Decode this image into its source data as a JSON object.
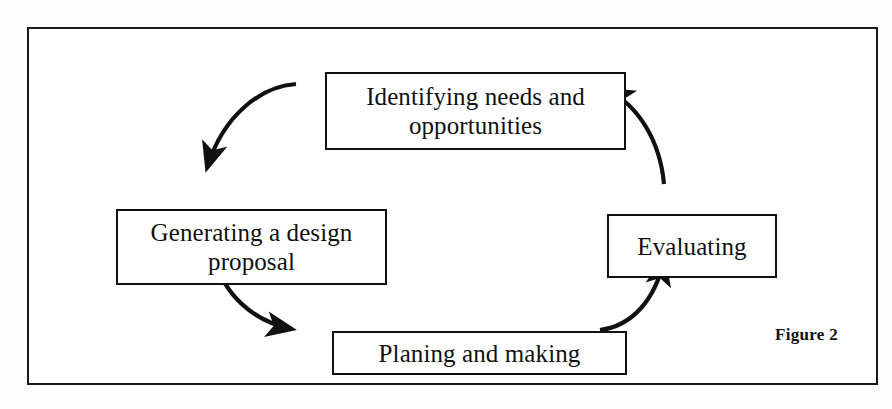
{
  "figure": {
    "caption": "Figure 2",
    "frame_color": "#1a1a1a",
    "background_color": "#ffffff",
    "stroke_color": "#111111"
  },
  "diagram": {
    "type": "cycle",
    "direction": "clockwise",
    "nodes": [
      {
        "id": "identifying",
        "label": "Identifying needs and opportunities",
        "line1": "Identifying needs and",
        "line2": "opportunities",
        "position": "top"
      },
      {
        "id": "generating",
        "label": "Generating a design proposal",
        "line1": "Generating a design",
        "line2": "proposal",
        "position": "left"
      },
      {
        "id": "planing",
        "label": "Planing and making",
        "line1": "Planing and making",
        "line2": "",
        "position": "bottom"
      },
      {
        "id": "evaluating",
        "label": "Evaluating",
        "line1": "Evaluating",
        "line2": "",
        "position": "right"
      }
    ],
    "edges": [
      {
        "id": "edge-identifying-generating",
        "from": "identifying",
        "to": "generating",
        "style": "curved-arrow"
      },
      {
        "id": "edge-generating-planing",
        "from": "generating",
        "to": "planing",
        "style": "curved-arrow"
      },
      {
        "id": "edge-planing-evaluating",
        "from": "planing",
        "to": "evaluating",
        "style": "curved-arrow"
      },
      {
        "id": "edge-evaluating-identifying",
        "from": "evaluating",
        "to": "identifying",
        "style": "curved-arrow"
      }
    ]
  }
}
